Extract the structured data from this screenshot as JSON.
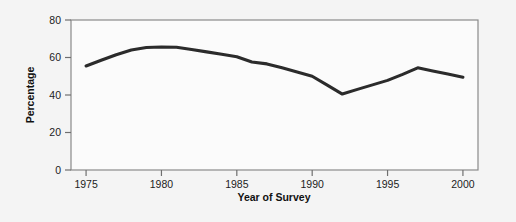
{
  "figure": {
    "background_color": "#f4f4f4",
    "plot_background_color": "#fbfbfb",
    "frame_color": "#8a8a8a"
  },
  "chart_data": {
    "type": "line",
    "title": "",
    "subtitle": "",
    "xlabel": "Year of Survey",
    "ylabel": "Percentage",
    "xlim": [
      1974,
      2001
    ],
    "ylim": [
      0,
      80
    ],
    "xticks": [
      1975,
      1980,
      1985,
      1990,
      1995,
      2000
    ],
    "xtick_labels": [
      "1975",
      "1980",
      "1985",
      "1990",
      "1995",
      "2000"
    ],
    "yticks": [
      0,
      20,
      40,
      60,
      80
    ],
    "ytick_labels": [
      "0",
      "20",
      "40",
      "60",
      "80"
    ],
    "grid": false,
    "legend": null,
    "legend_position": "none",
    "annotations": [],
    "series": [
      {
        "name": "Percentage",
        "color": "#2b2b2b",
        "line_width": 3,
        "x": [
          1975,
          1976,
          1977,
          1978,
          1979,
          1980,
          1981,
          1982,
          1983,
          1984,
          1985,
          1986,
          1987,
          1988,
          1989,
          1990,
          1991,
          1992,
          1993,
          1994,
          1995,
          1996,
          1997,
          1998,
          1999,
          2000
        ],
        "values": [
          55.5,
          58.5,
          61.5,
          64.0,
          65.3,
          65.6,
          65.5,
          64.3,
          63.0,
          61.7,
          60.4,
          57.6,
          56.6,
          54.5,
          52.3,
          50.0,
          45.3,
          40.5,
          43.0,
          45.4,
          47.8,
          51.0,
          54.5,
          52.8,
          51.2,
          49.5
        ]
      }
    ]
  }
}
